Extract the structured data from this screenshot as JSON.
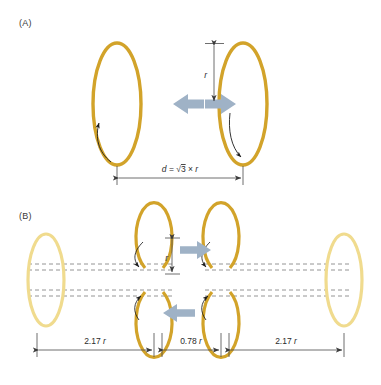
{
  "figure": {
    "type": "diagram",
    "title": "",
    "background_color": "#ffffff",
    "panels": [
      {
        "id": "A",
        "label": "(A)",
        "description": "Two vertical circular coils facing each other with repelling arrows between them",
        "loops": [
          {
            "name": "left-coil",
            "color": "#D2A32A",
            "rotation_arrow": "counterclockwise-up"
          },
          {
            "name": "right-coil",
            "color": "#D2A32A",
            "rotation_arrow": "clockwise-down"
          }
        ],
        "force_arrows": [
          {
            "name": "left-force-arrow",
            "direction": "left",
            "color": "#9FB2C6"
          },
          {
            "name": "right-force-arrow",
            "direction": "right",
            "color": "#9FB2C6"
          }
        ],
        "dimensions": [
          {
            "name": "radius-dimension",
            "label_parts": {
              "symbol": "r"
            },
            "label": "r",
            "orientation": "vertical"
          },
          {
            "name": "separation-dimension",
            "label": "d = √3 × r",
            "label_parts": {
              "symbol": "d",
              "equals": "=",
              "sqrt": "√",
              "radicand": "3",
              "times": "×",
              "factor": "r"
            },
            "orientation": "horizontal"
          }
        ]
      },
      {
        "id": "B",
        "label": "(B)",
        "description": "Row of six coaxial coils, outer two faded, four inner ones drawn solid with dashed axis lines",
        "loops": [
          {
            "name": "coil-far-left",
            "color": "#F0DB8E",
            "style": "faded"
          },
          {
            "name": "coil-inner-left-top",
            "color": "#D2A32A",
            "style": "solid"
          },
          {
            "name": "coil-inner-left-bottom",
            "color": "#D2A32A",
            "style": "solid"
          },
          {
            "name": "coil-inner-right-top",
            "color": "#D2A32A",
            "style": "solid"
          },
          {
            "name": "coil-inner-right-bottom",
            "color": "#D2A32A",
            "style": "solid"
          },
          {
            "name": "coil-far-right",
            "color": "#F0DB8E",
            "style": "faded"
          }
        ],
        "force_arrows": [
          {
            "name": "top-force-arrow",
            "direction": "right",
            "color": "#9FB2C6"
          },
          {
            "name": "bottom-force-arrow",
            "direction": "left",
            "color": "#9FB2C6"
          }
        ],
        "dimensions": [
          {
            "name": "radius-dimension-b",
            "label": "r",
            "orientation": "vertical"
          },
          {
            "name": "spacing-left-dimension",
            "label": "2.17 r",
            "label_parts": {
              "value": "2.17",
              "symbol": "r"
            },
            "orientation": "horizontal"
          },
          {
            "name": "spacing-center-dimension",
            "label": "0.78 r",
            "label_parts": {
              "value": "0.78",
              "symbol": "r"
            },
            "orientation": "horizontal"
          },
          {
            "name": "spacing-right-dimension",
            "label": "2.17 r",
            "label_parts": {
              "value": "2.17",
              "symbol": "r"
            },
            "orientation": "horizontal"
          }
        ]
      }
    ],
    "colors": {
      "coil_solid": "#D2A32A",
      "coil_faded": "#F0DB8E",
      "force_arrow": "#9FB2C6",
      "dimension_line": "#4a4a4a",
      "dashed_axis": "#7a7a7a",
      "text": "#2b2b2b"
    }
  }
}
